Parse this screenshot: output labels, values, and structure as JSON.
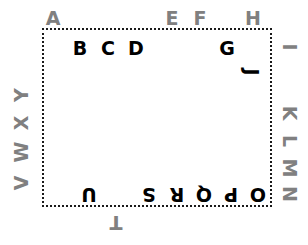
{
  "diagram": {
    "title": "",
    "colors": {
      "inside_letter": "#000000",
      "outside_letter": "#808080",
      "border": "#1a1a1a",
      "background": "#ffffff"
    },
    "boundary": {
      "shape": "rectangle",
      "border_style": "dotted",
      "x": 42,
      "y": 28,
      "width": 230,
      "height": 179
    },
    "letters": [
      {
        "label": "A",
        "x": 53,
        "y": 18,
        "rotation": 0,
        "placement": "outside",
        "side": "top"
      },
      {
        "label": "B",
        "x": 80,
        "y": 48,
        "rotation": 0,
        "placement": "inside",
        "side": "top"
      },
      {
        "label": "C",
        "x": 108,
        "y": 48,
        "rotation": 0,
        "placement": "inside",
        "side": "top"
      },
      {
        "label": "D",
        "x": 136,
        "y": 48,
        "rotation": 0,
        "placement": "inside",
        "side": "top"
      },
      {
        "label": "E",
        "x": 172,
        "y": 18,
        "rotation": 0,
        "placement": "outside",
        "side": "top"
      },
      {
        "label": "F",
        "x": 200,
        "y": 18,
        "rotation": 0,
        "placement": "outside",
        "side": "top"
      },
      {
        "label": "G",
        "x": 227,
        "y": 48,
        "rotation": 0,
        "placement": "inside",
        "side": "top"
      },
      {
        "label": "H",
        "x": 253,
        "y": 18,
        "rotation": 0,
        "placement": "outside",
        "side": "top"
      },
      {
        "label": "I",
        "x": 289,
        "y": 47,
        "rotation": 90,
        "placement": "outside",
        "side": "right"
      },
      {
        "label": "J",
        "x": 251,
        "y": 72,
        "rotation": 90,
        "placement": "inside",
        "side": "right"
      },
      {
        "label": "K",
        "x": 289,
        "y": 113,
        "rotation": 90,
        "placement": "outside",
        "side": "right"
      },
      {
        "label": "L",
        "x": 289,
        "y": 141,
        "rotation": 90,
        "placement": "outside",
        "side": "right"
      },
      {
        "label": "M",
        "x": 289,
        "y": 168,
        "rotation": 90,
        "placement": "outside",
        "side": "right"
      },
      {
        "label": "N",
        "x": 289,
        "y": 194,
        "rotation": 90,
        "placement": "outside",
        "side": "right"
      },
      {
        "label": "O",
        "x": 258,
        "y": 194,
        "rotation": 180,
        "placement": "inside",
        "side": "bottom"
      },
      {
        "label": "P",
        "x": 231,
        "y": 194,
        "rotation": 180,
        "placement": "inside",
        "side": "bottom"
      },
      {
        "label": "Q",
        "x": 204,
        "y": 194,
        "rotation": 180,
        "placement": "inside",
        "side": "bottom"
      },
      {
        "label": "R",
        "x": 177,
        "y": 194,
        "rotation": 180,
        "placement": "inside",
        "side": "bottom"
      },
      {
        "label": "S",
        "x": 149,
        "y": 194,
        "rotation": 180,
        "placement": "inside",
        "side": "bottom"
      },
      {
        "label": "T",
        "x": 116,
        "y": 222,
        "rotation": 180,
        "placement": "outside",
        "side": "bottom"
      },
      {
        "label": "U",
        "x": 89,
        "y": 194,
        "rotation": 180,
        "placement": "inside",
        "side": "bottom"
      },
      {
        "label": "V",
        "x": 21,
        "y": 183,
        "rotation": 270,
        "placement": "outside",
        "side": "left"
      },
      {
        "label": "W",
        "x": 21,
        "y": 152,
        "rotation": 270,
        "placement": "outside",
        "side": "left"
      },
      {
        "label": "X",
        "x": 21,
        "y": 123,
        "rotation": 270,
        "placement": "outside",
        "side": "left"
      },
      {
        "label": "Y",
        "x": 21,
        "y": 95,
        "rotation": 270,
        "placement": "outside",
        "side": "left"
      }
    ]
  }
}
